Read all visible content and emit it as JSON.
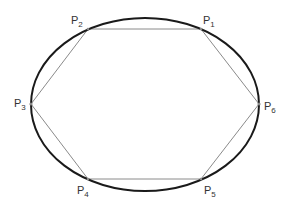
{
  "figure": {
    "colors": {
      "ellipse_stroke": "#1a1a1a",
      "polygon_stroke": "#8a8a8a",
      "label": "#333333",
      "background": "#ffffff"
    },
    "ellipse": {
      "cx": 145,
      "cy": 104.5,
      "rx": 114,
      "ry": 86.5
    },
    "vertices": [
      {
        "id": "P1",
        "base": "P",
        "sub": "1",
        "x": 201,
        "y": 29,
        "label_x": 203,
        "label_y": 24
      },
      {
        "id": "P2",
        "base": "P",
        "sub": "2",
        "x": 88,
        "y": 29,
        "label_x": 70,
        "label_y": 24
      },
      {
        "id": "P3",
        "base": "P",
        "sub": "3",
        "x": 31,
        "y": 104,
        "label_x": 13,
        "label_y": 107
      },
      {
        "id": "P4",
        "base": "P",
        "sub": "4",
        "x": 88,
        "y": 179,
        "label_x": 76,
        "label_y": 194
      },
      {
        "id": "P5",
        "base": "P",
        "sub": "5",
        "x": 201,
        "y": 179,
        "label_x": 203,
        "label_y": 194
      },
      {
        "id": "P6",
        "base": "P",
        "sub": "6",
        "x": 259,
        "y": 104,
        "label_x": 263,
        "label_y": 110
      }
    ],
    "labels": {
      "P1": {
        "base": "P",
        "sub": "1"
      },
      "P2": {
        "base": "P",
        "sub": "2"
      },
      "P3": {
        "base": "P",
        "sub": "3"
      },
      "P4": {
        "base": "P",
        "sub": "4"
      },
      "P5": {
        "base": "P",
        "sub": "5"
      },
      "P6": {
        "base": "P",
        "sub": "6"
      }
    }
  }
}
